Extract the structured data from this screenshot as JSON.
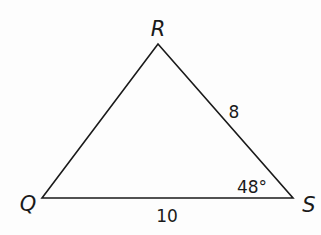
{
  "diagram": {
    "type": "triangle",
    "vertices": {
      "R": {
        "label": "R",
        "x": 158,
        "y": 44
      },
      "Q": {
        "label": "Q",
        "x": 42,
        "y": 198
      },
      "S": {
        "label": "S",
        "x": 293,
        "y": 198
      }
    },
    "sides": {
      "RS": {
        "label": "8"
      },
      "QS": {
        "label": "10"
      }
    },
    "angles": {
      "S": {
        "label": "48°"
      }
    },
    "colors": {
      "stroke": "#1a1a1a",
      "background": "#fdfdfd"
    }
  }
}
